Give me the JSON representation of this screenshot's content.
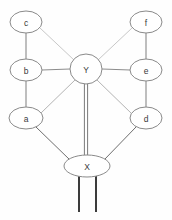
{
  "diagram": {
    "background_color": "#fefefe",
    "node_fill": "#ffffff",
    "node_stroke": "#8a8a8a",
    "label_color": "#3a3a3a",
    "edge_color_light": "#c8c8c8",
    "edge_color_mid": "#9a9a9a",
    "edge_color_dark": "#3c3c3c",
    "nodes": [
      {
        "id": "c",
        "label": "c",
        "cx": 26,
        "cy": 22,
        "rx": 16,
        "ry": 11
      },
      {
        "id": "f",
        "label": "f",
        "cx": 146,
        "cy": 22,
        "rx": 16,
        "ry": 11
      },
      {
        "id": "b",
        "label": "b",
        "cx": 26,
        "cy": 70,
        "rx": 16,
        "ry": 11
      },
      {
        "id": "e",
        "label": "e",
        "cx": 146,
        "cy": 70,
        "rx": 16,
        "ry": 11
      },
      {
        "id": "Y",
        "label": "Y",
        "cx": 86,
        "cy": 69,
        "rx": 16,
        "ry": 15
      },
      {
        "id": "a",
        "label": "a",
        "cx": 26,
        "cy": 118,
        "rx": 17,
        "ry": 11
      },
      {
        "id": "d",
        "label": "d",
        "cx": 146,
        "cy": 118,
        "rx": 16,
        "ry": 11
      },
      {
        "id": "X",
        "label": "X",
        "cx": 87,
        "cy": 166,
        "rx": 23,
        "ry": 11
      }
    ],
    "edges": [
      {
        "id": "c-b",
        "from": "c",
        "to": "b",
        "x1": 26,
        "y1": 33,
        "x2": 26,
        "y2": 59,
        "style": "single",
        "color": "#7e7e7e"
      },
      {
        "id": "c-Y",
        "from": "c",
        "to": "Y",
        "x1": 40,
        "y1": 28,
        "x2": 74,
        "y2": 60,
        "style": "single",
        "color": "#c8c8c8"
      },
      {
        "id": "f-e",
        "from": "f",
        "to": "e",
        "x1": 146,
        "y1": 33,
        "x2": 146,
        "y2": 59,
        "style": "single",
        "color": "#7e7e7e"
      },
      {
        "id": "f-Y",
        "from": "f",
        "to": "Y",
        "x1": 132,
        "y1": 28,
        "x2": 98,
        "y2": 60,
        "style": "single",
        "color": "#c8c8c8"
      },
      {
        "id": "b-Y",
        "from": "b",
        "to": "Y",
        "x1": 42,
        "y1": 70,
        "x2": 70,
        "y2": 69,
        "style": "single",
        "color": "#8c8c8c"
      },
      {
        "id": "e-Y",
        "from": "e",
        "to": "Y",
        "x1": 130,
        "y1": 70,
        "x2": 102,
        "y2": 69,
        "style": "single",
        "color": "#8c8c8c"
      },
      {
        "id": "b-a",
        "from": "b",
        "to": "a",
        "x1": 26,
        "y1": 81,
        "x2": 26,
        "y2": 107,
        "style": "single",
        "color": "#7e7e7e"
      },
      {
        "id": "e-d",
        "from": "e",
        "to": "d",
        "x1": 146,
        "y1": 81,
        "x2": 146,
        "y2": 107,
        "style": "single",
        "color": "#7e7e7e"
      },
      {
        "id": "a-Y",
        "from": "a",
        "to": "Y",
        "x1": 41,
        "y1": 113,
        "x2": 75,
        "y2": 80,
        "style": "single",
        "color": "#b4b4b4"
      },
      {
        "id": "d-Y",
        "from": "d",
        "to": "Y",
        "x1": 131,
        "y1": 113,
        "x2": 97,
        "y2": 80,
        "style": "single",
        "color": "#b4b4b4"
      },
      {
        "id": "a-X",
        "from": "a",
        "to": "X",
        "x1": 36,
        "y1": 127,
        "x2": 70,
        "y2": 160,
        "style": "single",
        "color": "#6e6e6e"
      },
      {
        "id": "d-X",
        "from": "d",
        "to": "X",
        "x1": 136,
        "y1": 127,
        "x2": 104,
        "y2": 160,
        "style": "single",
        "color": "#6e6e6e"
      },
      {
        "id": "Y-X",
        "from": "Y",
        "to": "X",
        "x1": 86,
        "y1": 84,
        "x2": 86,
        "y2": 155,
        "style": "double",
        "color": "#7a7a7a"
      }
    ],
    "terminals": [
      {
        "id": "x-terminal-left",
        "x1": 79,
        "y1": 174,
        "x2": 79,
        "y2": 212,
        "color": "#3c3c3c"
      },
      {
        "id": "x-terminal-right",
        "x1": 96,
        "y1": 174,
        "x2": 96,
        "y2": 212,
        "color": "#3c3c3c"
      }
    ]
  }
}
